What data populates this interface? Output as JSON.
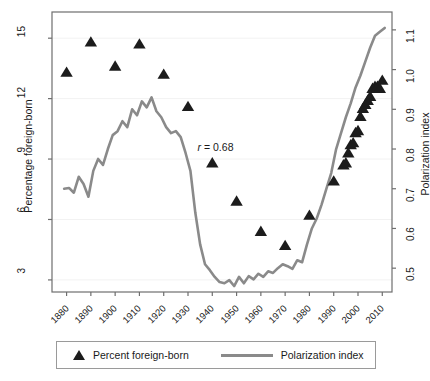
{
  "axes": {
    "left_title": "Percentage foreign-born",
    "right_title": "Polarization index",
    "left_ticks": [
      "15",
      "12",
      "9",
      "6",
      "3"
    ],
    "left_values": [
      15,
      12,
      9,
      6,
      3
    ],
    "right_ticks": [
      "1.1",
      "1.0",
      "0.9",
      "0.8",
      "0.7",
      "0.6",
      "0.5"
    ],
    "right_values": [
      1.1,
      1.0,
      0.9,
      0.8,
      0.7,
      0.6,
      0.5
    ],
    "x_ticks": [
      "1880",
      "1890",
      "1900",
      "1910",
      "1920",
      "1930",
      "1940",
      "1950",
      "1960",
      "1970",
      "1980",
      "1990",
      "2000",
      "2010"
    ],
    "x_values": [
      1880,
      1890,
      1900,
      1910,
      1920,
      1930,
      1940,
      1950,
      1960,
      1970,
      1980,
      1990,
      2000,
      2010
    ]
  },
  "annotation": {
    "text": "r = 0.68",
    "symbol": "r",
    "equals": " = ",
    "value": "0.68"
  },
  "legend": {
    "foreign_born_label": "Percent foreign-born",
    "polarization_label": "Polarization index"
  },
  "colors": {
    "marker": "#1c1c1c",
    "line": "#8a8a8a",
    "frame": "#6e6e6e",
    "grid": "#f2f2f2",
    "text": "#1a1a1a"
  },
  "chart_data": {
    "type": "scatter",
    "title": "",
    "xlabel": "",
    "ylabel": "Percentage foreign-born",
    "y2label": "Polarization index",
    "xlim": [
      1874,
      2014
    ],
    "ylim": [
      2.4,
      16.3
    ],
    "y2lim": [
      0.44,
      1.145
    ],
    "grid": true,
    "legend_position": "bottom",
    "annotations": [
      {
        "text": "r = 0.68",
        "x": 1943,
        "y": 9.55
      }
    ],
    "series": [
      {
        "name": "Percent foreign-born",
        "type": "scatter",
        "marker": "triangle",
        "axis": "left",
        "color": "#1c1c1c",
        "x": [
          1880,
          1890,
          1900,
          1910,
          1920,
          1930,
          1940,
          1950,
          1960,
          1970,
          1980,
          1990,
          1994,
          1995,
          1996,
          1997,
          1998,
          1999,
          2000,
          2001,
          2002,
          2003,
          2004,
          2005,
          2006,
          2007,
          2008,
          2009,
          2010
        ],
        "y": [
          13.3,
          14.8,
          13.6,
          14.7,
          13.2,
          11.6,
          8.8,
          6.9,
          5.4,
          4.7,
          6.2,
          7.9,
          8.7,
          8.8,
          9.3,
          9.7,
          9.8,
          10.3,
          10.4,
          11.1,
          11.5,
          11.7,
          11.9,
          12.1,
          12.5,
          12.6,
          12.6,
          12.5,
          12.9
        ]
      },
      {
        "name": "Polarization index",
        "type": "line",
        "axis": "right",
        "color": "#8a8a8a",
        "x": [
          1879,
          1881,
          1883,
          1885,
          1887,
          1889,
          1891,
          1893,
          1895,
          1897,
          1899,
          1901,
          1903,
          1905,
          1907,
          1909,
          1911,
          1913,
          1915,
          1917,
          1919,
          1921,
          1923,
          1925,
          1927,
          1929,
          1931,
          1933,
          1935,
          1937,
          1939,
          1941,
          1943,
          1945,
          1947,
          1949,
          1951,
          1953,
          1955,
          1957,
          1959,
          1961,
          1963,
          1965,
          1967,
          1969,
          1971,
          1973,
          1975,
          1977,
          1979,
          1981,
          1983,
          1985,
          1987,
          1989,
          1991,
          1993,
          1995,
          1997,
          1999,
          2001,
          2003,
          2005,
          2007,
          2009,
          2011
        ],
        "y": [
          0.7,
          0.702,
          0.69,
          0.73,
          0.712,
          0.68,
          0.745,
          0.775,
          0.76,
          0.8,
          0.835,
          0.845,
          0.87,
          0.855,
          0.9,
          0.885,
          0.92,
          0.905,
          0.93,
          0.895,
          0.88,
          0.855,
          0.84,
          0.845,
          0.83,
          0.79,
          0.745,
          0.64,
          0.56,
          0.51,
          0.495,
          0.478,
          0.465,
          0.462,
          0.47,
          0.455,
          0.478,
          0.462,
          0.48,
          0.472,
          0.486,
          0.478,
          0.492,
          0.488,
          0.5,
          0.51,
          0.505,
          0.498,
          0.52,
          0.515,
          0.56,
          0.6,
          0.625,
          0.66,
          0.7,
          0.74,
          0.8,
          0.84,
          0.88,
          0.915,
          0.955,
          0.985,
          1.02,
          1.055,
          1.085,
          1.095,
          1.105
        ]
      }
    ]
  }
}
